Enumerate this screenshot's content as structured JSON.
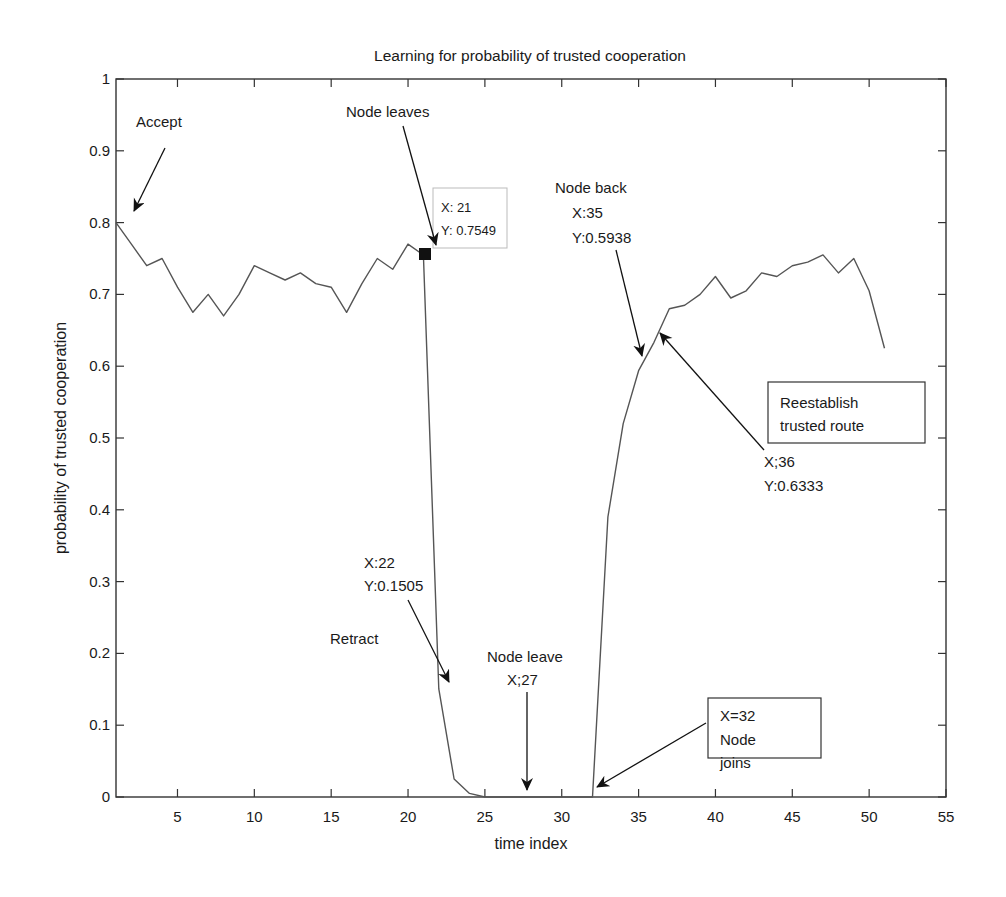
{
  "chart_data": {
    "type": "line",
    "title": "Learning for probability of trusted cooperation",
    "xlabel": "time index",
    "ylabel": "probability of trusted cooperation",
    "xlim": [
      1,
      55
    ],
    "ylim": [
      0,
      1
    ],
    "grid": false,
    "legend": null,
    "xticks": [
      5,
      10,
      15,
      20,
      25,
      30,
      35,
      40,
      45,
      50,
      55
    ],
    "xtick_labels": [
      "5",
      "10",
      "15",
      "20",
      "25",
      "30",
      "35",
      "40",
      "45",
      "50",
      "55"
    ],
    "yticks": [
      0,
      0.1,
      0.2,
      0.3,
      0.4,
      0.5,
      0.6,
      0.7,
      0.8,
      0.9,
      1
    ],
    "ytick_labels": [
      "0",
      "0.1",
      "0.2",
      "0.3",
      "0.4",
      "0.5",
      "0.6",
      "0.7",
      "0.8",
      "0.9",
      "1"
    ],
    "series": [
      {
        "name": "probability of trusted cooperation",
        "color": "#555555",
        "x": [
          1,
          2,
          3,
          4,
          5,
          6,
          7,
          8,
          9,
          10,
          11,
          12,
          13,
          14,
          15,
          16,
          17,
          18,
          19,
          20,
          21,
          22,
          23,
          24,
          25,
          26,
          27,
          28,
          29,
          30,
          31,
          32,
          33,
          34,
          35,
          36,
          37,
          38,
          39,
          40,
          41,
          42,
          43,
          44,
          45,
          46,
          47,
          48,
          49,
          50,
          51
        ],
        "y": [
          0.8,
          0.77,
          0.74,
          0.75,
          0.71,
          0.675,
          0.7,
          0.67,
          0.7,
          0.74,
          0.73,
          0.72,
          0.73,
          0.715,
          0.71,
          0.675,
          0.715,
          0.75,
          0.735,
          0.77,
          0.7549,
          0.1505,
          0.025,
          0.005,
          0.0,
          0.0,
          0.0,
          0.0,
          0.0,
          0.0,
          0.0,
          0.0,
          0.39,
          0.52,
          0.5938,
          0.6333,
          0.68,
          0.685,
          0.7,
          0.725,
          0.695,
          0.705,
          0.73,
          0.725,
          0.74,
          0.745,
          0.755,
          0.73,
          0.75,
          0.705,
          0.625
        ]
      }
    ],
    "datatip": {
      "x_label": "X: 21",
      "y_label": "Y: 0.7549",
      "x": 21,
      "y": 0.7549
    },
    "annotations": [
      {
        "id": "accept",
        "lines": [
          "Accept"
        ],
        "points_to": [
          1,
          0.8
        ]
      },
      {
        "id": "node-leaves",
        "lines": [
          "Node leaves"
        ],
        "points_to": [
          21,
          0.7549
        ]
      },
      {
        "id": "node-back",
        "lines": [
          "Node back",
          "X:35",
          "Y:0.5938"
        ],
        "points_to": [
          35,
          0.5938
        ]
      },
      {
        "id": "reestablish",
        "lines": [
          "Reestablish",
          "trusted route"
        ],
        "boxed": true
      },
      {
        "id": "reestablish-point",
        "lines": [
          "X;36",
          "Y:0.6333"
        ],
        "points_to": [
          36,
          0.6333
        ]
      },
      {
        "id": "retract-point",
        "lines": [
          "X:22",
          "Y:0.1505"
        ],
        "points_to": [
          22,
          0.1505
        ]
      },
      {
        "id": "retract",
        "lines": [
          "Retract"
        ]
      },
      {
        "id": "node-leave",
        "lines": [
          "Node leave",
          "X;27"
        ],
        "points_to": [
          27.5,
          0.0
        ]
      },
      {
        "id": "node-joins",
        "lines": [
          "X=32",
          "Node",
          "joins"
        ],
        "boxed": true,
        "points_to": [
          32,
          0.0
        ]
      }
    ]
  },
  "labels": {
    "title": "Learning for probability of trusted cooperation",
    "xlabel": "time index",
    "ylabel": "probability of trusted cooperation",
    "datatip_x": "X: 21",
    "datatip_y": "Y: 0.7549",
    "accept": "Accept",
    "node_leaves": "Node leaves",
    "node_back": "Node back",
    "node_back_x": "X:35",
    "node_back_y": "Y:0.5938",
    "reestablish_1": "Reestablish",
    "reestablish_2": "trusted route",
    "reestablish_x": "X;36",
    "reestablish_y": "Y:0.6333",
    "retract_x": "X:22",
    "retract_y": "Y:0.1505",
    "retract": "Retract",
    "node_leave": "Node leave",
    "node_leave_x": "X;27",
    "node_joins_1": "X=32",
    "node_joins_2": "Node",
    "node_joins_3": "joins"
  }
}
